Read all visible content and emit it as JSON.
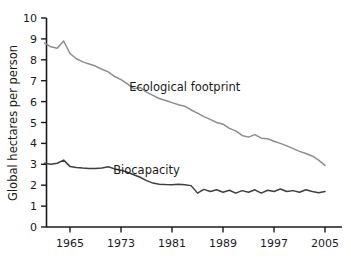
{
  "chart_data": {
    "type": "line",
    "title": "",
    "xlabel": "",
    "ylabel": "Global hectares per person",
    "xlim": [
      1961,
      2005
    ],
    "ylim": [
      0,
      10
    ],
    "grid": false,
    "legend_position": "inline-annotations",
    "xticks": [
      "1965",
      "1973",
      "1981",
      "1989",
      "1997",
      "2005"
    ],
    "xtick_values": [
      1965,
      1973,
      1981,
      1989,
      1997,
      2005
    ],
    "yticks": [
      "0",
      "1",
      "2",
      "3",
      "4",
      "5",
      "6",
      "7",
      "8",
      "9",
      "10"
    ],
    "ytick_values": [
      0,
      1,
      2,
      3,
      4,
      5,
      6,
      7,
      8,
      9,
      10
    ],
    "x": [
      1961,
      1962,
      1963,
      1964,
      1965,
      1966,
      1967,
      1968,
      1969,
      1970,
      1971,
      1972,
      1973,
      1974,
      1975,
      1976,
      1977,
      1978,
      1979,
      1980,
      1981,
      1982,
      1983,
      1984,
      1985,
      1986,
      1987,
      1988,
      1989,
      1990,
      1991,
      1992,
      1993,
      1994,
      1995,
      1996,
      1997,
      1998,
      1999,
      2000,
      2001,
      2002,
      2003,
      2004,
      2005
    ],
    "series": [
      {
        "name": "Ecological footprint",
        "color": "#8d8d8d",
        "label_x": 1983,
        "label_y": 6.5,
        "values": [
          8.8,
          8.62,
          8.55,
          8.9,
          8.3,
          8.05,
          7.9,
          7.8,
          7.7,
          7.55,
          7.42,
          7.2,
          7.05,
          6.85,
          6.62,
          6.68,
          6.45,
          6.3,
          6.15,
          6.05,
          5.95,
          5.85,
          5.78,
          5.6,
          5.45,
          5.28,
          5.15,
          5.0,
          4.92,
          4.72,
          4.6,
          4.38,
          4.3,
          4.42,
          4.25,
          4.22,
          4.1,
          4.0,
          3.88,
          3.75,
          3.62,
          3.52,
          3.4,
          3.2,
          2.95
        ]
      },
      {
        "name": "Biocapacity",
        "color": "#3f3f3f",
        "label_x": 1977,
        "label_y": 2.55,
        "values": [
          3.05,
          3.0,
          3.05,
          3.2,
          2.9,
          2.85,
          2.82,
          2.8,
          2.8,
          2.82,
          2.88,
          2.78,
          2.72,
          2.62,
          2.5,
          2.38,
          2.22,
          2.1,
          2.05,
          2.03,
          2.02,
          2.05,
          2.02,
          1.98,
          1.62,
          1.8,
          1.7,
          1.78,
          1.66,
          1.76,
          1.62,
          1.74,
          1.66,
          1.78,
          1.62,
          1.76,
          1.7,
          1.82,
          1.7,
          1.74,
          1.66,
          1.78,
          1.7,
          1.64,
          1.7
        ]
      }
    ]
  }
}
